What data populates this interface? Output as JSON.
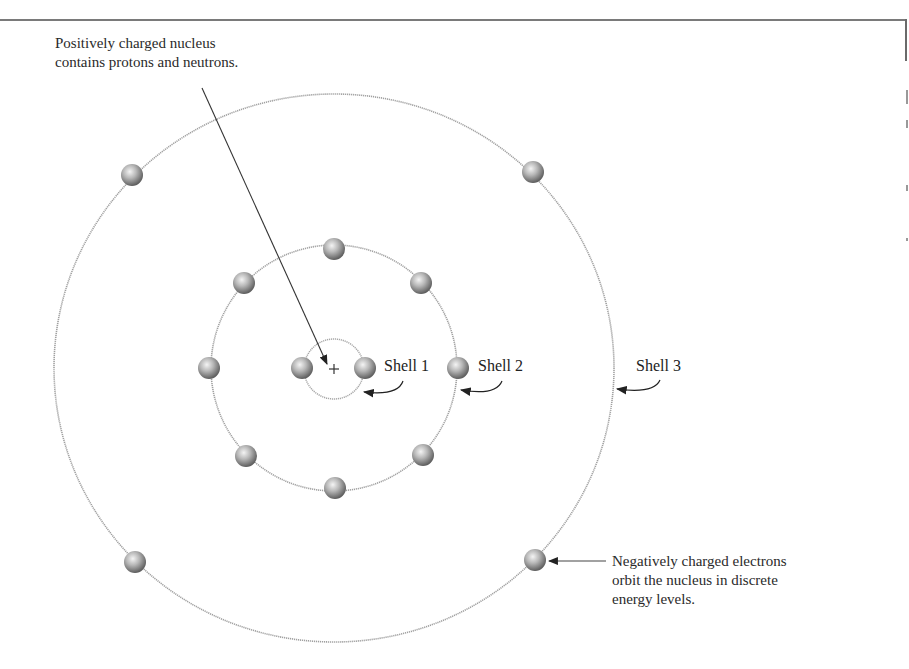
{
  "diagram": {
    "annotations": {
      "nucleus": {
        "lines": [
          "Positively charged nucleus",
          "contains protons and neutrons."
        ]
      },
      "electrons": {
        "lines": [
          "Negatively charged electrons",
          "orbit the nucleus in discrete",
          "energy levels."
        ]
      }
    },
    "nucleus_symbol": "+",
    "shells": [
      {
        "label": "Shell 1",
        "electron_count": 2
      },
      {
        "label": "Shell 2",
        "electron_count": 8
      },
      {
        "label": "Shell 3",
        "electron_count": 4
      }
    ],
    "colors": {
      "orbit": "#9a9a9a",
      "electron_light": "#f2f2f2",
      "electron_dark": "#6e6e6e",
      "arrow": "#333333",
      "frame": "#7a7a7a"
    }
  }
}
